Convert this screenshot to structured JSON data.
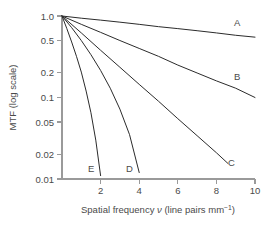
{
  "chart_data": {
    "type": "line",
    "title": "",
    "xlabel": "Spatial frequency ν (line pairs mm⁻¹)",
    "xlabel_main": "Spatial frequency",
    "xlabel_symbol": "ν",
    "xlabel_units": "(line pairs mm",
    "xlabel_units_exp": "−1",
    "xlabel_units_close": ")",
    "ylabel": "MTF (log scale)",
    "yscale": "log",
    "xscale": "linear",
    "xlim": [
      0,
      10
    ],
    "ylim": [
      0.01,
      1.0
    ],
    "grid": false,
    "legend": "inline-curve-labels",
    "xticks": [
      2,
      4,
      6,
      8,
      10
    ],
    "xtick_labels": [
      "2",
      "4",
      "6",
      "8",
      "10"
    ],
    "yticks": [
      1.0,
      0.5,
      0.2,
      0.1,
      0.05,
      0.02,
      0.01
    ],
    "ytick_labels": [
      "1.0",
      "0.5",
      "0.2",
      "0.1",
      "0.05",
      "0.02",
      "0.01"
    ],
    "series": [
      {
        "name": "A",
        "label": "A",
        "x": [
          0,
          1,
          2,
          3,
          4,
          5,
          6,
          7,
          8,
          9,
          10
        ],
        "values": [
          1.0,
          0.94,
          0.89,
          0.84,
          0.79,
          0.74,
          0.7,
          0.66,
          0.62,
          0.58,
          0.55
        ]
      },
      {
        "name": "B",
        "label": "B",
        "x": [
          0,
          1,
          2,
          3,
          4,
          5,
          6,
          7,
          8,
          9,
          10
        ],
        "values": [
          1.0,
          0.79,
          0.63,
          0.5,
          0.4,
          0.32,
          0.25,
          0.2,
          0.16,
          0.13,
          0.1
        ]
      },
      {
        "name": "C",
        "label": "C",
        "x": [
          0,
          1,
          2,
          3,
          4,
          5,
          6,
          7,
          8,
          8.6
        ],
        "values": [
          1.0,
          0.62,
          0.38,
          0.235,
          0.145,
          0.09,
          0.055,
          0.034,
          0.021,
          0.0155
        ]
      },
      {
        "name": "D",
        "label": "D",
        "x": [
          0,
          0.5,
          1,
          1.5,
          2,
          2.5,
          3,
          3.5,
          4
        ],
        "values": [
          1.0,
          0.72,
          0.5,
          0.335,
          0.215,
          0.13,
          0.072,
          0.035,
          0.012
        ]
      },
      {
        "name": "E",
        "label": "E",
        "x": [
          0,
          0.25,
          0.5,
          0.75,
          1,
          1.25,
          1.5,
          1.75,
          2
        ],
        "values": [
          1.0,
          0.7,
          0.48,
          0.32,
          0.205,
          0.12,
          0.065,
          0.03,
          0.011
        ]
      }
    ]
  }
}
